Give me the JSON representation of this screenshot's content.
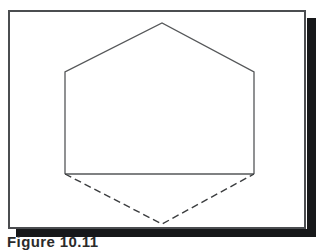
{
  "figure": {
    "caption": "Figure 10.11",
    "frame": {
      "border_color": "#4b4d50",
      "background_color": "#ffffff",
      "shadow_color": "#17181a"
    },
    "drawing": {
      "title": "Hexagon with solid upper outline and dashed lower outline",
      "stroke_color": "#555759",
      "stroke_width": 1.3,
      "solid_path_label": "hexagon-upper-solid-outline",
      "chord_label": "hexagon-lower-chord",
      "dashed_path_label": "hexagon-lower-dashed-outline",
      "dash_pattern": "7 4",
      "vertices": [
        {
          "name": "top",
          "x": 152,
          "y": 11
        },
        {
          "name": "upper-right",
          "x": 244,
          "y": 60
        },
        {
          "name": "lower-right",
          "x": 244,
          "y": 162
        },
        {
          "name": "bottom",
          "x": 152,
          "y": 212
        },
        {
          "name": "lower-left",
          "x": 55,
          "y": 162
        },
        {
          "name": "upper-left",
          "x": 55,
          "y": 60
        }
      ]
    }
  }
}
